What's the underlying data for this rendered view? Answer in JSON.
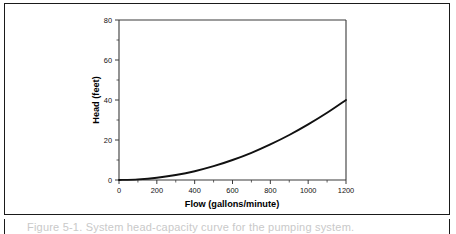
{
  "figure": {
    "caption": "Figure 5-1.  System head-capacity curve for the pumping system.",
    "border_color": "#1a1a1a",
    "background": "#ffffff"
  },
  "chart_data": {
    "type": "line",
    "title": "",
    "subtitle": "",
    "xlabel": "Flow (gallons/minute)",
    "ylabel": "Head (feet)",
    "xlim": [
      0,
      1200
    ],
    "ylim": [
      0,
      80
    ],
    "grid": false,
    "legend": null,
    "curve_color": "#111111",
    "x_major_ticks": [
      0,
      200,
      400,
      600,
      800,
      1000,
      1200
    ],
    "x_minor_ticks": [
      100,
      300,
      500,
      700,
      900,
      1100
    ],
    "x_ticklabels": [
      "0",
      "200",
      "400",
      "600",
      "800",
      "1000",
      "1200"
    ],
    "y_major_ticks": [
      0,
      20,
      40,
      60,
      80
    ],
    "y_minor_ticks": [
      10,
      30,
      50,
      70
    ],
    "y_ticklabels": [
      "0",
      "20",
      "40",
      "60",
      "80"
    ],
    "series": [
      {
        "name": "System head curve",
        "x": [
          0,
          100,
          200,
          300,
          400,
          500,
          600,
          700,
          800,
          900,
          1000,
          1100,
          1200
        ],
        "values": [
          0.0,
          0.3,
          1.1,
          2.5,
          4.4,
          6.9,
          10.0,
          13.6,
          17.8,
          22.5,
          27.8,
          33.6,
          40.0
        ]
      }
    ],
    "annotations": []
  }
}
